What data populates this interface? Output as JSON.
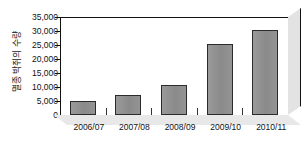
{
  "chart_data": {
    "type": "bar",
    "title": "",
    "xlabel": "",
    "ylabel": "멸종 박쥐의 수량",
    "categories": [
      "2006/07",
      "2007/08",
      "2008/09",
      "2009/10",
      "2010/11"
    ],
    "values": [
      5000,
      7200,
      10600,
      25400,
      30200
    ],
    "ylim": [
      0,
      35000
    ],
    "ytick_labels": [
      "0",
      "5,000",
      "10,000",
      "15,000",
      "20,000",
      "25,000",
      "30,000",
      "35,000"
    ],
    "ytick_values": [
      0,
      5000,
      10000,
      15000,
      20000,
      25000,
      30000,
      35000
    ],
    "grid": false,
    "legend": "none",
    "bar_color": "#8f8f8f",
    "bar_border_color": "#2b2b2b",
    "axis_color": "#111111",
    "background_color": "#ffffff",
    "style": "3d-column"
  }
}
